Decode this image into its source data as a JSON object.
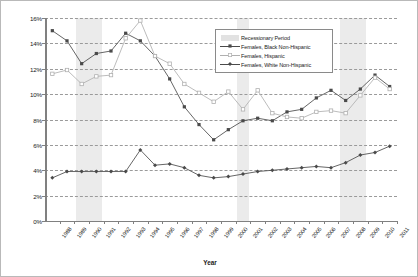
{
  "chart_data": {
    "type": "line",
    "title": "",
    "xlabel": "Year",
    "ylabel": "",
    "ylim": [
      0,
      16
    ],
    "ytick_labels": [
      "0%",
      "2%",
      "4%",
      "6%",
      "8%",
      "10%",
      "12%",
      "14%",
      "16%"
    ],
    "ytick_values": [
      0,
      2,
      4,
      6,
      8,
      10,
      12,
      14,
      16
    ],
    "grid": true,
    "legend_position": "top-right",
    "x": [
      "1988",
      "1989",
      "1990",
      "1991",
      "1992",
      "1993",
      "1994",
      "1995",
      "1996",
      "1997",
      "1998",
      "1999",
      "2000",
      "2001",
      "2002",
      "2003",
      "2004",
      "2005",
      "2006",
      "2007",
      "2008",
      "2009",
      "2010",
      "2011"
    ],
    "categories": [
      "1988",
      "1989",
      "1990",
      "1991",
      "1992",
      "1993",
      "1994",
      "1995",
      "1996",
      "1997",
      "1998",
      "1999",
      "2000",
      "2001",
      "2002",
      "2003",
      "2004",
      "2005",
      "2006",
      "2007",
      "2008",
      "2009",
      "2010",
      "2011"
    ],
    "series": [
      {
        "name": "Females, Black Non-Hispanic",
        "marker": "filled-square",
        "color": "#4a4a4a",
        "values": [
          15.0,
          14.2,
          12.4,
          13.2,
          13.4,
          14.8,
          14.2,
          13.0,
          11.2,
          9.0,
          7.6,
          6.4,
          7.2,
          7.9,
          8.1,
          7.9,
          8.6,
          8.8,
          9.7,
          10.3,
          9.5,
          10.4,
          11.5,
          10.6
        ]
      },
      {
        "name": "Females, Hispanic",
        "marker": "open-square",
        "color": "#b0b0b0",
        "values": [
          11.6,
          11.9,
          10.8,
          11.4,
          11.5,
          14.4,
          15.8,
          13.0,
          12.4,
          10.8,
          10.1,
          9.4,
          10.2,
          8.8,
          10.3,
          8.5,
          8.2,
          8.1,
          8.6,
          8.7,
          8.5,
          9.9,
          11.3,
          10.4
        ]
      },
      {
        "name": "Females, White Non-Hispanic",
        "marker": "filled-diamond",
        "color": "#4a4a4a",
        "values": [
          3.4,
          3.9,
          3.9,
          3.9,
          3.9,
          3.9,
          5.6,
          4.4,
          4.5,
          4.2,
          3.6,
          3.4,
          3.5,
          3.7,
          3.9,
          4.0,
          4.1,
          4.2,
          4.3,
          4.2,
          4.6,
          5.2,
          5.4,
          5.9
        ]
      }
    ],
    "recession_bands": [
      {
        "label": "Recessionary Period",
        "start": "1990",
        "end": "1991"
      },
      {
        "label": "Recessionary Period",
        "start": "2001",
        "end": "2001"
      },
      {
        "label": "Recessionary Period",
        "start": "2008",
        "end": "2009"
      }
    ]
  },
  "legend": {
    "items": [
      {
        "label": "Recessionary Period",
        "key": "band"
      },
      {
        "label": "Females, Black Non-Hispanic",
        "key": "line-filled-square"
      },
      {
        "label": "Females, Hispanic",
        "key": "line-open-square"
      },
      {
        "label": "Females, White Non-Hispanic",
        "key": "line-filled-diamond"
      }
    ]
  },
  "axis": {
    "x_title": "Year"
  },
  "colors": {
    "dark_series": "#4a4a4a",
    "light_series": "#b0b0b0",
    "grid": "#9a9a9a",
    "axis": "#808080",
    "recession_band": "#d8d8d8"
  }
}
